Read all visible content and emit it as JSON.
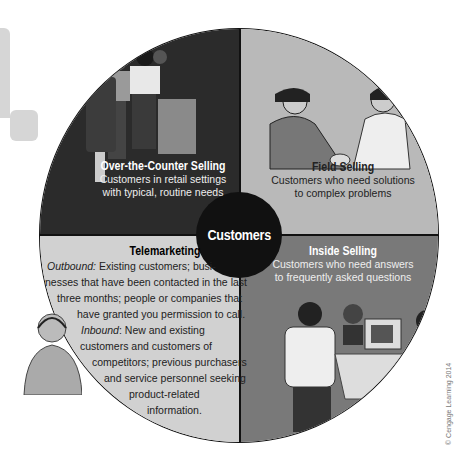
{
  "diagram": {
    "center_label": "Customers",
    "quadrants": [
      {
        "id": "over-the-counter",
        "title": "Over-the-Counter Selling",
        "description_lines": [
          "Customers in retail settings",
          "with typical, routine needs"
        ],
        "fill": "#2b2b2b"
      },
      {
        "id": "field",
        "title": "Field Selling",
        "description_lines": [
          "Customers who need solutions",
          "to complex problems"
        ],
        "fill": "#b9b9b9"
      },
      {
        "id": "telemarketing",
        "title": "Telemarketing",
        "fill": "#d1d1d1",
        "lines": [
          {
            "italic": "Outbound:",
            "text": " Existing customers; busi-"
          },
          {
            "italic": "",
            "text": "nesses that have been contacted in the last"
          },
          {
            "italic": "",
            "text": "three months; people or companies that"
          },
          {
            "italic": "",
            "text": "have granted you permission to call."
          },
          {
            "italic": "Inbound",
            "text": ": New and existing"
          },
          {
            "italic": "",
            "text": "customers and customers of"
          },
          {
            "italic": "",
            "text": "competitors; previous purchasers"
          },
          {
            "italic": "",
            "text": "and service personnel seeking"
          },
          {
            "italic": "",
            "text": "product-related"
          },
          {
            "italic": "",
            "text": "information."
          }
        ]
      },
      {
        "id": "inside",
        "title": "Inside Selling",
        "description_lines": [
          "Customers who need answers",
          "to frequently asked questions"
        ],
        "fill": "#797979"
      }
    ],
    "illustrations": [
      "people-in-line-at-counter",
      "handshake",
      "woman-on-phone-headset",
      "office-workers-at-computer"
    ],
    "copyright": "© Cengage Learning 2014"
  }
}
